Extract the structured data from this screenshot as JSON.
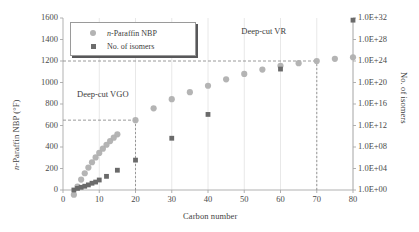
{
  "chart_data": {
    "type": "scatter",
    "title": "",
    "xlabel": "Carbon number",
    "ylabel": "n-Paraffin NBP (°F)",
    "ylabel_right": "No. of isomers",
    "xlim": [
      0,
      80
    ],
    "ylim": [
      0,
      1600
    ],
    "ylim_right_log10": [
      0,
      32
    ],
    "xticks": [
      0,
      10,
      20,
      30,
      40,
      50,
      60,
      70,
      80
    ],
    "xtick_labels": [
      "0",
      "10",
      "20",
      "30",
      "40",
      "50",
      "60",
      "70",
      "80"
    ],
    "yticks_left": [
      0,
      200,
      400,
      600,
      800,
      1000,
      1200,
      1400,
      1600
    ],
    "ytick_labels_left": [
      "0",
      "200",
      "400",
      "600",
      "800",
      "1000",
      "1200",
      "1400",
      "1600"
    ],
    "yticks_right_log10": [
      0,
      4,
      8,
      12,
      16,
      20,
      24,
      28,
      32
    ],
    "ytick_labels_right": [
      "1.0E+00",
      "1.0E+04",
      "1.0E+08",
      "1.0E+12",
      "1.0E+16",
      "1.0E+20",
      "1.0E+24",
      "1.0E+28",
      "1.0E+32"
    ],
    "grid": "vertical-only",
    "legend_position": "upper-left-inside",
    "series": [
      {
        "name": "n-Paraffin NBP",
        "marker": "circle",
        "color": "#b0b0b0",
        "axis": "left",
        "points": [
          {
            "x": 3,
            "y": -44
          },
          {
            "x": 4,
            "y": 31
          },
          {
            "x": 5,
            "y": 97
          },
          {
            "x": 6,
            "y": 156
          },
          {
            "x": 7,
            "y": 209
          },
          {
            "x": 8,
            "y": 258
          },
          {
            "x": 9,
            "y": 303
          },
          {
            "x": 10,
            "y": 345
          },
          {
            "x": 11,
            "y": 384
          },
          {
            "x": 12,
            "y": 421
          },
          {
            "x": 13,
            "y": 455
          },
          {
            "x": 14,
            "y": 487
          },
          {
            "x": 15,
            "y": 518
          },
          {
            "x": 20,
            "y": 650
          },
          {
            "x": 25,
            "y": 760
          },
          {
            "x": 30,
            "y": 845
          },
          {
            "x": 35,
            "y": 910
          },
          {
            "x": 40,
            "y": 970
          },
          {
            "x": 45,
            "y": 1030
          },
          {
            "x": 50,
            "y": 1080
          },
          {
            "x": 55,
            "y": 1120
          },
          {
            "x": 60,
            "y": 1155
          },
          {
            "x": 65,
            "y": 1180
          },
          {
            "x": 70,
            "y": 1200
          },
          {
            "x": 75,
            "y": 1220
          },
          {
            "x": 80,
            "y": 1235
          }
        ]
      },
      {
        "name": "No. of isomers",
        "marker": "square",
        "color": "#6a6a6a",
        "axis": "right",
        "points": [
          {
            "x": 3,
            "y_log10": 0.0
          },
          {
            "x": 4,
            "y_log10": 0.3
          },
          {
            "x": 5,
            "y_log10": 0.5
          },
          {
            "x": 6,
            "y_log10": 0.7
          },
          {
            "x": 7,
            "y_log10": 0.95
          },
          {
            "x": 8,
            "y_log10": 1.26
          },
          {
            "x": 9,
            "y_log10": 1.48
          },
          {
            "x": 10,
            "y_log10": 1.86
          },
          {
            "x": 12,
            "y_log10": 2.54
          },
          {
            "x": 15,
            "y_log10": 3.68
          },
          {
            "x": 20,
            "y_log10": 5.56
          },
          {
            "x": 30,
            "y_log10": 9.63
          },
          {
            "x": 40,
            "y_log10": 14.06
          },
          {
            "x": 60,
            "y_log10": 22.5
          },
          {
            "x": 80,
            "y_log10": 31.6
          }
        ]
      }
    ],
    "reference_lines": [
      {
        "name": "deep-cut-vgo-horizontal",
        "type": "horizontal",
        "y": 650,
        "x_from": 0,
        "x_to": 20,
        "style": "dashed"
      },
      {
        "name": "deep-cut-vgo-vertical",
        "type": "vertical",
        "x": 20,
        "y_from": 0,
        "y_to": 650,
        "style": "dashed"
      },
      {
        "name": "deep-cut-vr-horizontal",
        "type": "horizontal",
        "y": 1200,
        "x_from": 0,
        "x_to": 70,
        "style": "dashed"
      },
      {
        "name": "deep-cut-vr-vertical",
        "type": "vertical",
        "x": 70,
        "y_from": 0,
        "y_to": 1200,
        "style": "dashed"
      }
    ],
    "annotations": [
      {
        "name": "deep-cut-vgo",
        "text": "Deep-cut VGO",
        "x": 16,
        "y": 880
      },
      {
        "name": "deep-cut-vr",
        "text": "Deep-cut VR",
        "x": 58,
        "y": 1470
      }
    ],
    "legend": [
      {
        "label": "n-Paraffin NBP",
        "marker": "circle",
        "color": "#b0b0b0"
      },
      {
        "label": "No. of isomers",
        "marker": "square",
        "color": "#6a6a6a"
      }
    ]
  },
  "axes": {
    "x_title": "Carbon number",
    "y_left_title_prefix": "n",
    "y_left_title_rest": "-Paraffin NBP (°F)",
    "y_right_title": "No. of isomers"
  },
  "legend": {
    "item1_label_prefix": "n",
    "item1_label_rest": "-Paraffin NBP",
    "item2_label": "No. of isomers"
  },
  "annotations": {
    "vgo": "Deep-cut VGO",
    "vr": "Deep-cut VR"
  },
  "colors": {
    "nbp_marker": "#b0b0b0",
    "isomer_marker": "#6a6a6a",
    "axis": "#a8a8a8",
    "grid": "#e2e2e2",
    "dashed_ref": "#8f8f8f",
    "text": "#3f3f3f",
    "background": "#ffffff"
  }
}
